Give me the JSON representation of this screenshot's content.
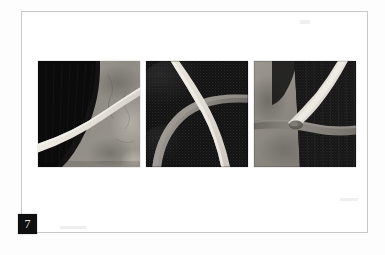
{
  "page": {
    "background_color": "#fdfdfd",
    "frame_border_color": "#c9c9c9",
    "frame_fill_color": "#ffffff"
  },
  "figure": {
    "number_label": "7",
    "number_chip_background": "#100f0f",
    "number_chip_text_color": "#e3e3e3",
    "caption": ""
  },
  "palette": {
    "near_black": "#121212",
    "dark_charcoal": "#1f1f1f",
    "mid_gray": "#8d8d8d",
    "light_gray": "#b9b9b9",
    "pale_band": "#e6e4df",
    "warm_gray": "#a09a93",
    "deep_shadow": "#0a0a0a"
  },
  "panels": [
    {
      "name": "panel-1",
      "alt": "Abstract textile square: black curved field at left against mottled gray ground, crossed by a pale diagonal band rising to the right",
      "base_color": "#9a9792",
      "dark_field_color": "#121212",
      "band_color": "#e6e4df",
      "band_description": "pale band from lower-left to upper-right",
      "texture": "mottled-wash"
    },
    {
      "name": "panel-2",
      "alt": "Abstract textile square: near-black stitched ground with a pale band arcing from top-left to bottom-right and a gray band arcing from lower-left to right edge",
      "base_color": "#141414",
      "dark_field_color": "#0c0c0c",
      "band_color": "#ddd9d1",
      "secondary_band_color": "#8e8b85",
      "band_description": "two crossing arcs forming an X",
      "texture": "fine-stitch"
    },
    {
      "name": "panel-3",
      "alt": "Abstract textile square: dark stitched blocks at right and gray field at left, a pale band descending from top-right and a horizontal gray seam across the middle",
      "base_color": "#8b8781",
      "dark_field_color": "#161616",
      "band_color": "#e2ded6",
      "secondary_band_color": "#7d7974",
      "band_description": "pale wedge from top-right meeting a horizontal seam",
      "texture": "fine-stitch"
    }
  ]
}
